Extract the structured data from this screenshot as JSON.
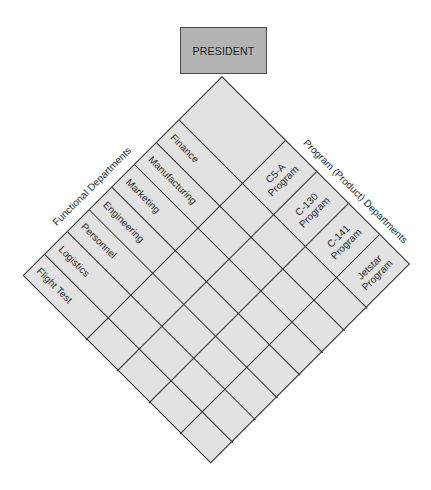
{
  "diagram": {
    "title_box": {
      "label": "PRESIDENT",
      "fill": "#b3b3b3",
      "border": "#4a4a4a"
    },
    "matrix": {
      "fill": "#e2e2e2",
      "line_color": "#2e2e2e",
      "functional_axis_label": "Functional Departments",
      "program_axis_label": "Program (Product) Departments",
      "functional_departments": [
        {
          "label": "Finance"
        },
        {
          "label": "Manufacturing"
        },
        {
          "label": "Marketing"
        },
        {
          "label": "Engineering"
        },
        {
          "label": "Personnel"
        },
        {
          "label": "Logistics"
        },
        {
          "label": "Flight Test"
        }
      ],
      "programs": [
        {
          "line1": "C5-A",
          "line2": "Program"
        },
        {
          "line1": "C-130",
          "line2": "Program"
        },
        {
          "line1": "C-141",
          "line2": "Program"
        },
        {
          "line1": "Jetstar",
          "line2": "Program"
        }
      ]
    }
  }
}
